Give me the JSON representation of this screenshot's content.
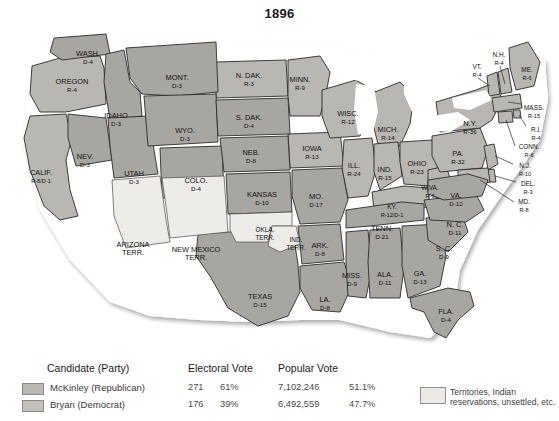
{
  "title": "1896",
  "colors": {
    "republican": "#b9b7b2",
    "democrat": "#a8a6a1",
    "territory": "#eeece8",
    "water": "#ffffff",
    "border": "#2b2b2b",
    "text": "#111111"
  },
  "map": {
    "states": [
      {
        "code": "WASH",
        "name": "WASH.",
        "vote": "D-4",
        "party": "democrat",
        "x": 88,
        "y": 36
      },
      {
        "code": "OREG",
        "name": "OREGON",
        "vote": "R-4",
        "party": "republican",
        "x": 72,
        "y": 64
      },
      {
        "code": "CALIF",
        "name": "CALIF.",
        "vote": "R-8/D-1",
        "party": "republican",
        "x": 41,
        "y": 155
      },
      {
        "code": "IDAHO",
        "name": "IDAHO",
        "vote": "D-3",
        "party": "democrat",
        "x": 116,
        "y": 98
      },
      {
        "code": "NEV",
        "name": "NEV.",
        "vote": "D-3",
        "party": "democrat",
        "x": 85,
        "y": 139
      },
      {
        "code": "UTAH",
        "name": "UTAH",
        "vote": "D-3",
        "party": "democrat",
        "x": 134,
        "y": 156
      },
      {
        "code": "MONT",
        "name": "MONT.",
        "vote": "D-3",
        "party": "democrat",
        "x": 177,
        "y": 60
      },
      {
        "code": "WYO",
        "name": "WYO.",
        "vote": "D-3",
        "party": "democrat",
        "x": 185,
        "y": 113
      },
      {
        "code": "COLO",
        "name": "COLO.",
        "vote": "D-4",
        "party": "democrat",
        "x": 196,
        "y": 163
      },
      {
        "code": "ARIZ",
        "name": "ARIZONA",
        "vote": "TERR.",
        "party": "territory",
        "x": 133,
        "y": 227
      },
      {
        "code": "NMEX",
        "name": "NEW MEXICO",
        "vote": "TERR.",
        "party": "territory",
        "x": 196,
        "y": 232
      },
      {
        "code": "NDAK",
        "name": "N. DAK.",
        "vote": "R-3",
        "party": "republican",
        "x": 249,
        "y": 58
      },
      {
        "code": "SDAK",
        "name": "S. DAK.",
        "vote": "D-4",
        "party": "democrat",
        "x": 249,
        "y": 100
      },
      {
        "code": "NEB",
        "name": "NEB.",
        "vote": "D-8",
        "party": "democrat",
        "x": 251,
        "y": 135
      },
      {
        "code": "KANS",
        "name": "KANSAS",
        "vote": "D-10",
        "party": "democrat",
        "x": 262,
        "y": 177
      },
      {
        "code": "OKLA",
        "name": "OKLA.",
        "vote": "TERR.",
        "party": "territory",
        "x": 265,
        "y": 212
      },
      {
        "code": "INDT",
        "name": "IND.",
        "vote": "TERR.",
        "party": "territory",
        "x": 296,
        "y": 222
      },
      {
        "code": "TEXAS",
        "name": "TEXAS",
        "vote": "D-15",
        "party": "democrat",
        "x": 260,
        "y": 279
      },
      {
        "code": "MINN",
        "name": "MINN.",
        "vote": "R-9",
        "party": "republican",
        "x": 300,
        "y": 62
      },
      {
        "code": "IOWA",
        "name": "IOWA",
        "vote": "R-13",
        "party": "republican",
        "x": 312,
        "y": 131
      },
      {
        "code": "MO",
        "name": "MO.",
        "vote": "D-17",
        "party": "democrat",
        "x": 316,
        "y": 179
      },
      {
        "code": "ARK",
        "name": "ARK.",
        "vote": "D-8",
        "party": "democrat",
        "x": 320,
        "y": 228
      },
      {
        "code": "LA",
        "name": "LA.",
        "vote": "D-8",
        "party": "democrat",
        "x": 325,
        "y": 282
      },
      {
        "code": "WISC",
        "name": "WISC.",
        "vote": "R-12",
        "party": "republican",
        "x": 348,
        "y": 96
      },
      {
        "code": "ILL",
        "name": "ILL.",
        "vote": "R-24",
        "party": "republican",
        "x": 354,
        "y": 148
      },
      {
        "code": "MISS",
        "name": "MISS.",
        "vote": "D-9",
        "party": "democrat",
        "x": 352,
        "y": 258
      },
      {
        "code": "MICH",
        "name": "MICH.",
        "vote": "R-14",
        "party": "republican",
        "x": 388,
        "y": 112
      },
      {
        "code": "IND",
        "name": "IND.",
        "vote": "R-15",
        "party": "republican",
        "x": 385,
        "y": 152
      },
      {
        "code": "OHIO",
        "name": "OHIO",
        "vote": "R-23",
        "party": "republican",
        "x": 417,
        "y": 146
      },
      {
        "code": "KY",
        "name": "KY.",
        "vote": "R-12/D-1",
        "party": "republican",
        "x": 392,
        "y": 189
      },
      {
        "code": "TENN",
        "name": "TENN.",
        "vote": "D-21",
        "party": "democrat",
        "x": 382,
        "y": 211
      },
      {
        "code": "ALA",
        "name": "ALA.",
        "vote": "D-11",
        "party": "democrat",
        "x": 385,
        "y": 257
      },
      {
        "code": "GA",
        "name": "GA.",
        "vote": "D-13",
        "party": "democrat",
        "x": 420,
        "y": 256
      },
      {
        "code": "FLA",
        "name": "FLA.",
        "vote": "D-4",
        "party": "democrat",
        "x": 446,
        "y": 294
      },
      {
        "code": "SC",
        "name": "S. C.",
        "vote": "D-9",
        "party": "democrat",
        "x": 444,
        "y": 231
      },
      {
        "code": "NC",
        "name": "N. C.",
        "vote": "D-11",
        "party": "democrat",
        "x": 455,
        "y": 207
      },
      {
        "code": "VA",
        "name": "VA.",
        "vote": "D-12",
        "party": "democrat",
        "x": 456,
        "y": 178
      },
      {
        "code": "WVA",
        "name": "W.VA.",
        "vote": "R-6",
        "party": "republican",
        "x": 430,
        "y": 170
      },
      {
        "code": "PA",
        "name": "PA.",
        "vote": "R-32",
        "party": "republican",
        "x": 458,
        "y": 136
      },
      {
        "code": "NY",
        "name": "N.Y.",
        "vote": "R-36",
        "party": "republican",
        "x": 470,
        "y": 106
      },
      {
        "code": "VT",
        "name": "VT.",
        "vote": "R-4",
        "party": "republican",
        "x": 477,
        "y": 49
      },
      {
        "code": "NH",
        "name": "N.H.",
        "vote": "R-4",
        "party": "republican",
        "x": 499,
        "y": 37
      },
      {
        "code": "ME",
        "name": "ME.",
        "vote": "R-6",
        "party": "republican",
        "x": 527,
        "y": 52
      },
      {
        "code": "MASS",
        "name": "MASS.",
        "vote": "R-15",
        "party": "republican",
        "x": 534,
        "y": 90
      },
      {
        "code": "RI",
        "name": "R.I.",
        "vote": "R-4",
        "party": "republican",
        "x": 536,
        "y": 112
      },
      {
        "code": "CONN",
        "name": "CONN.",
        "vote": "R-6",
        "party": "republican",
        "x": 529,
        "y": 129
      },
      {
        "code": "NJ",
        "name": "N.J.",
        "vote": "R-10",
        "party": "republican",
        "x": 525,
        "y": 148
      },
      {
        "code": "DEL",
        "name": "DEL.",
        "vote": "R-3",
        "party": "republican",
        "x": 528,
        "y": 166
      },
      {
        "code": "MD",
        "name": "MD.",
        "vote": "R-8",
        "party": "republican",
        "x": 524,
        "y": 184
      }
    ]
  },
  "legend": {
    "headers": {
      "candidate": "Candidate (Party)",
      "electoral": "Electoral Vote",
      "popular": "Popular Vote"
    },
    "rows": [
      {
        "candidate": "McKinley (Republican)",
        "party": "republican",
        "electoral_votes": "271",
        "electoral_pct": "61%",
        "popular_votes": "7,102,246",
        "popular_pct": "51.1%"
      },
      {
        "candidate": "Bryan (Democrat)",
        "party": "democrat",
        "electoral_votes": "176",
        "electoral_pct": "39%",
        "popular_votes": "6,492,559",
        "popular_pct": "47.7%"
      }
    ],
    "territory_note_line1": "Territories, Indian",
    "territory_note_line2": "reservations, unsettled, etc."
  }
}
